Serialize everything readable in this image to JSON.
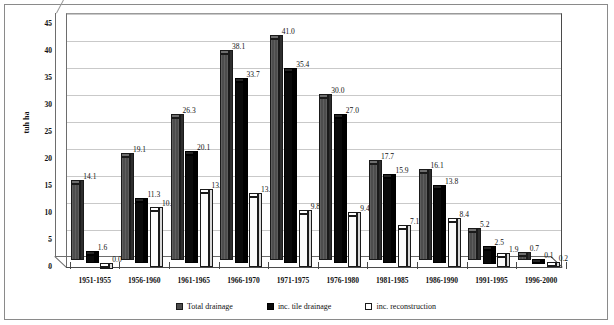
{
  "chart_data": {
    "type": "bar",
    "title": "",
    "xlabel": "",
    "ylabel": "tuh ha",
    "ylim": [
      0,
      45
    ],
    "ytick_interval": 5,
    "yticks": [
      "0",
      "5",
      "10",
      "15",
      "20",
      "25",
      "30",
      "35",
      "40",
      "45"
    ],
    "grid": true,
    "grid_axis": "y",
    "legend_position": "bottom",
    "style": "3d-clustered-column",
    "categories": [
      "1951-1955",
      "1956-1960",
      "1961-1965",
      "1966-1970",
      "1971-1975",
      "1976-1980",
      "1981-1985",
      "1986-1990",
      "1991-1995",
      "1996-2000"
    ],
    "series": [
      {
        "name": "Total drainage",
        "color": "#4d4d4d",
        "values": [
          14.1,
          19.1,
          26.3,
          38.1,
          41.0,
          30.0,
          17.7,
          16.1,
          5.2,
          0.7
        ],
        "labels": [
          "14.1",
          "19.1",
          "26.3",
          "38.1",
          "41.0",
          "30.0",
          "17.7",
          "16.1",
          "5.2",
          "0.7"
        ]
      },
      {
        "name": "inc. tile drainage",
        "color": "#0a0a0a",
        "values": [
          1.6,
          11.3,
          20.1,
          33.7,
          35.4,
          27.0,
          15.9,
          13.8,
          2.5,
          0.1
        ],
        "labels": [
          "1.6",
          "11.3",
          "20.1",
          "33.7",
          "35.4",
          "27.0",
          "15.9",
          "13.8",
          "2.5",
          "0.1"
        ]
      },
      {
        "name": "inc. reconstruction",
        "color": "#ffffff",
        "values": [
          0.0,
          10.3,
          13.7,
          13.0,
          9.8,
          9.4,
          7.1,
          8.4,
          1.9,
          0.2
        ],
        "labels": [
          "0.0",
          "10.3",
          "13.7",
          "13.0",
          "9.8",
          "9.4",
          "7.1",
          "8.4",
          "1.9",
          "0.2"
        ]
      }
    ]
  },
  "legend": {
    "items": [
      {
        "label": "Total drainage",
        "swatch": "square-dark-grey"
      },
      {
        "label": "inc. tile drainage",
        "swatch": "square-black"
      },
      {
        "label": "inc. reconstruction",
        "swatch": "square-white"
      }
    ]
  },
  "axis": {
    "y_title": "tuh ha"
  }
}
